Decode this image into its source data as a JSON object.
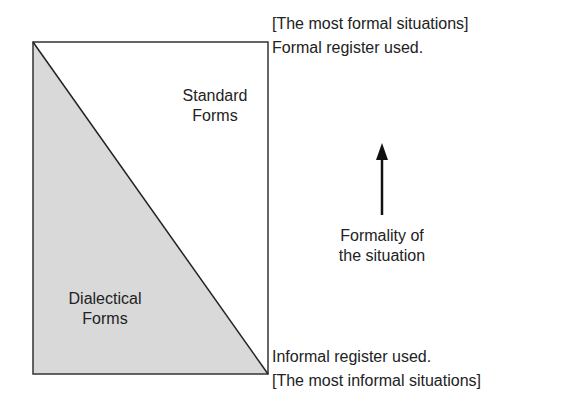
{
  "diagram": {
    "regions": {
      "standard": {
        "line1": "Standard",
        "line2": "Forms"
      },
      "dialectical": {
        "line1": "Dialectical",
        "line2": "Forms"
      }
    },
    "top_labels": {
      "line1": "[The most formal situations]",
      "line2": "Formal register used."
    },
    "bottom_labels": {
      "line1": "Informal register used.",
      "line2": "[The most informal situations]"
    },
    "axis": {
      "line1": "Formality of",
      "line2": "the situation",
      "direction": "up"
    },
    "colors": {
      "shaded_fill": "#d9d9d9",
      "line": "#222222",
      "background": "#ffffff"
    }
  }
}
